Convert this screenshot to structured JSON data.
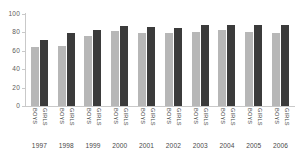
{
  "chart_data": {
    "type": "bar",
    "title": "",
    "subtitle": "",
    "xlabel": "",
    "ylabel": "",
    "ylim": [
      0,
      100
    ],
    "yticks": [
      0,
      20,
      40,
      60,
      80,
      100
    ],
    "ytick_labels": [
      "0",
      "20",
      "40",
      "60",
      "80",
      "100"
    ],
    "grid": false,
    "legend": null,
    "legend_position": "none",
    "categories": [
      "1997",
      "1998",
      "1999",
      "2000",
      "2001",
      "2002",
      "2003",
      "2004",
      "2005",
      "2006"
    ],
    "series": [
      {
        "name": "BOYS",
        "color": "#b7b7b7",
        "values": [
          64,
          65,
          76,
          81,
          79,
          79,
          80,
          83,
          80,
          79
        ]
      },
      {
        "name": "GIRLS",
        "color": "#3b3b3b",
        "values": [
          72,
          79,
          83,
          87,
          86,
          85,
          88,
          88,
          88,
          88
        ]
      }
    ],
    "group_tick_labels": [
      "BOYS",
      "GIRLS"
    ],
    "axis_color": "#c9c9c9",
    "text_color": "#4a4a4a",
    "background": "#ffffff"
  }
}
